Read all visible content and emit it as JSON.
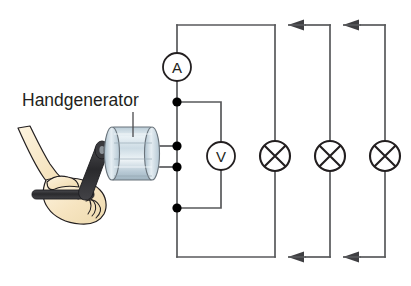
{
  "diagram": {
    "label": "Handgenerator",
    "background_color": "#ffffff",
    "wire_color": "#58595b",
    "symbol_color": "#231f20",
    "node_color": "#000000",
    "generator_body_color": "#c3d3dd",
    "generator_body_highlight": "#e8f0f4",
    "generator_frame_color": "#3b3b3f",
    "hand_fill_color": "#f7e6c4",
    "hand_outline_color": "#231f20",
    "crank_color": "#2b2b2b"
  },
  "meters": {
    "ammeter": {
      "symbol": "A",
      "name": "ammeter",
      "cx": 177,
      "cy": 67,
      "r": 14
    },
    "voltmeter": {
      "symbol": "V",
      "name": "voltmeter",
      "cx": 221,
      "cy": 156,
      "r": 14
    }
  },
  "lamps": [
    {
      "name": "lamp-1",
      "symbol": "lamp-x-circle",
      "cx": 275,
      "cy": 156,
      "r": 15
    },
    {
      "name": "lamp-2",
      "symbol": "lamp-x-circle",
      "cx": 330,
      "cy": 156,
      "r": 15
    },
    {
      "name": "lamp-3",
      "symbol": "lamp-x-circle",
      "cx": 385,
      "cy": 156,
      "r": 15
    }
  ],
  "nodes": [
    {
      "name": "node-top-terminal",
      "cx": 177,
      "cy": 102,
      "r": 4.6
    },
    {
      "name": "node-generator-plus",
      "cx": 177,
      "cy": 146,
      "r": 4.6
    },
    {
      "name": "node-generator-minus",
      "cx": 177,
      "cy": 167,
      "r": 4.6
    },
    {
      "name": "node-bottom-terminal",
      "cx": 177,
      "cy": 208,
      "r": 4.6
    }
  ],
  "arrows": [
    {
      "name": "current-arrow-top-left",
      "x": 300,
      "y": 25,
      "direction": "left"
    },
    {
      "name": "current-arrow-top-right",
      "x": 355,
      "y": 25,
      "direction": "left"
    },
    {
      "name": "current-arrow-bottom-left",
      "x": 300,
      "y": 257,
      "direction": "left"
    },
    {
      "name": "current-arrow-bottom-right",
      "x": 355,
      "y": 257,
      "direction": "left"
    }
  ],
  "geometry": {
    "rail_left_x": 177,
    "rail_top_y": 25,
    "rail_bottom_y": 257,
    "branch1_x": 275,
    "branch2_x": 330,
    "branch3_x": 385,
    "volt_branch_top_y": 102,
    "volt_branch_bottom_y": 208,
    "volt_branch_x": 221
  }
}
